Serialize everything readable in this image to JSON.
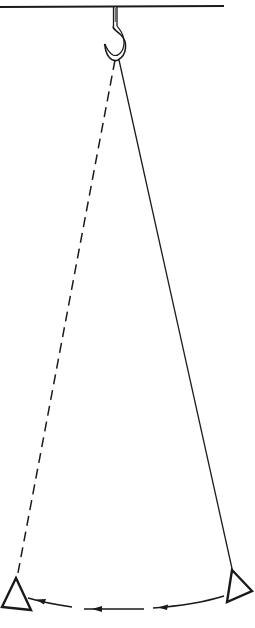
{
  "diagram": {
    "type": "pendulum-swing",
    "colors": {
      "ink": "#1a1a1a",
      "background": "#ffffff"
    },
    "ceiling": {
      "x1": 0,
      "y1": 7,
      "x2": 224,
      "y2": 7
    },
    "hook": {
      "x": 117,
      "top": 7,
      "bottom": 60
    },
    "pivot": {
      "x": 118,
      "y": 60
    },
    "current_position": {
      "string_style": "solid",
      "bob": "triangle",
      "bob_center": [
        238,
        588
      ]
    },
    "previous_position": {
      "string_style": "dashed",
      "bob": "triangle",
      "bob_center": [
        16,
        596
      ]
    },
    "swing_arc": {
      "direction": "right-to-left",
      "arrow_count": 3
    }
  }
}
